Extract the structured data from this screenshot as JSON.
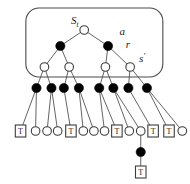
{
  "figure": {
    "type": "search-tree-diagram",
    "title": "",
    "colors": {
      "stroke": "#3c3c3c",
      "node_fill_open": "#ffffff",
      "node_fill_solid": "#000000",
      "box_stroke": "#4a4a4a",
      "label": "#1a1a1a",
      "background": "#ffffff"
    },
    "labels": [
      {
        "id": "root-state-label",
        "text": "S",
        "sub": "t",
        "x": 78,
        "y": 24
      },
      {
        "id": "action-label",
        "text": "a",
        "sub": "",
        "x": 133,
        "y": 35
      },
      {
        "id": "reward-label",
        "text": "r",
        "sub": "",
        "x": 140,
        "y": 48
      },
      {
        "id": "next-state-label",
        "text": "s",
        "sub": "",
        "prime": true,
        "x": 155,
        "y": 62
      }
    ],
    "rounded_box": {
      "x": 27,
      "y": 8,
      "width": 155,
      "height": 69,
      "radius": 13
    },
    "levels": {
      "level1_root": [
        {
          "id": "n-root",
          "kind": "open",
          "x": 93,
          "y": 30
        }
      ],
      "level2_actions": [
        {
          "id": "n-a1",
          "kind": "solid",
          "x": 66,
          "y": 46
        },
        {
          "id": "n-a2",
          "kind": "solid",
          "x": 120,
          "y": 46
        }
      ],
      "level3_states": [
        {
          "id": "n-s1",
          "kind": "open",
          "x": 48,
          "y": 67
        },
        {
          "id": "n-s2",
          "kind": "open",
          "x": 76,
          "y": 67
        },
        {
          "id": "n-s3",
          "kind": "open",
          "x": 117,
          "y": 67
        },
        {
          "id": "n-s4",
          "kind": "open",
          "x": 145,
          "y": 67
        }
      ],
      "level4_actions": [
        {
          "id": "n-b1",
          "kind": "solid",
          "x": 39,
          "y": 88
        },
        {
          "id": "n-b2",
          "kind": "solid",
          "x": 56,
          "y": 88
        },
        {
          "id": "n-b3",
          "kind": "solid",
          "x": 70,
          "y": 88
        },
        {
          "id": "n-b4",
          "kind": "solid",
          "x": 87,
          "y": 88
        },
        {
          "id": "n-b5",
          "kind": "solid",
          "x": 110,
          "y": 88
        },
        {
          "id": "n-b6",
          "kind": "solid",
          "x": 126,
          "y": 88
        },
        {
          "id": "n-b7",
          "kind": "solid",
          "x": 143,
          "y": 88
        },
        {
          "id": "n-b8",
          "kind": "solid",
          "x": 164,
          "y": 88
        }
      ],
      "level5_leaves": [
        {
          "id": "l-1",
          "kind": "terminal",
          "label": "T",
          "x": 21,
          "y": 131
        },
        {
          "id": "l-2",
          "kind": "open",
          "label": "",
          "x": 38,
          "y": 131
        },
        {
          "id": "l-3",
          "kind": "open",
          "label": "",
          "x": 51,
          "y": 131
        },
        {
          "id": "l-4",
          "kind": "open",
          "label": "",
          "x": 63,
          "y": 131
        },
        {
          "id": "l-5",
          "kind": "terminal",
          "label": "T",
          "x": 78,
          "y": 131
        },
        {
          "id": "l-6",
          "kind": "open",
          "label": "",
          "x": 92,
          "y": 131
        },
        {
          "id": "l-7",
          "kind": "open",
          "label": "",
          "x": 104,
          "y": 131
        },
        {
          "id": "l-8",
          "kind": "open",
          "label": "",
          "x": 116,
          "y": 131
        },
        {
          "id": "l-9",
          "kind": "terminal",
          "label": "T",
          "x": 130,
          "y": 131
        },
        {
          "id": "l-10",
          "kind": "open",
          "label": "",
          "x": 144,
          "y": 131
        },
        {
          "id": "l-11",
          "kind": "open",
          "label": "",
          "x": 157,
          "y": 131
        },
        {
          "id": "l-12",
          "kind": "terminal",
          "label": "T",
          "x": 171,
          "y": 131
        },
        {
          "id": "l-13",
          "kind": "terminal",
          "label": "T",
          "x": 189,
          "y": 131
        },
        {
          "id": "l-14",
          "kind": "open",
          "label": "",
          "x": 204,
          "y": 131
        }
      ],
      "level6_extra": [
        {
          "id": "n-x1",
          "kind": "solid",
          "label": "",
          "x": 157,
          "y": 152
        }
      ],
      "level7_extra": [
        {
          "id": "l-x1",
          "kind": "terminal",
          "label": "T",
          "x": 157,
          "y": 172
        }
      ]
    },
    "edges": [
      {
        "from": "n-root",
        "to": "n-a1"
      },
      {
        "from": "n-root",
        "to": "n-a2"
      },
      {
        "from": "n-a1",
        "to": "n-s1"
      },
      {
        "from": "n-a1",
        "to": "n-s2"
      },
      {
        "from": "n-a2",
        "to": "n-s3"
      },
      {
        "from": "n-a2",
        "to": "n-s4"
      },
      {
        "from": "n-s1",
        "to": "n-b1"
      },
      {
        "from": "n-s1",
        "to": "n-b2"
      },
      {
        "from": "n-s2",
        "to": "n-b3"
      },
      {
        "from": "n-s2",
        "to": "n-b4"
      },
      {
        "from": "n-s3",
        "to": "n-b5"
      },
      {
        "from": "n-s3",
        "to": "n-b6"
      },
      {
        "from": "n-s4",
        "to": "n-b7"
      },
      {
        "from": "n-s4",
        "to": "n-b8"
      },
      {
        "from": "n-b1",
        "to": "l-1"
      },
      {
        "from": "n-b1",
        "to": "l-2"
      },
      {
        "from": "n-b2",
        "to": "l-3"
      },
      {
        "from": "n-b2",
        "to": "l-4"
      },
      {
        "from": "n-b3",
        "to": "l-5"
      },
      {
        "from": "n-b4",
        "to": "l-6"
      },
      {
        "from": "n-b4",
        "to": "l-7"
      },
      {
        "from": "n-b5",
        "to": "l-8"
      },
      {
        "from": "n-b5",
        "to": "l-9"
      },
      {
        "from": "n-b6",
        "to": "l-10"
      },
      {
        "from": "n-b6",
        "to": "l-11"
      },
      {
        "from": "n-b7",
        "to": "l-12"
      },
      {
        "from": "n-b8",
        "to": "l-13"
      },
      {
        "from": "n-b8",
        "to": "l-14"
      },
      {
        "from": "l-11",
        "to": "n-x1"
      },
      {
        "from": "n-x1",
        "to": "l-x1"
      }
    ]
  }
}
